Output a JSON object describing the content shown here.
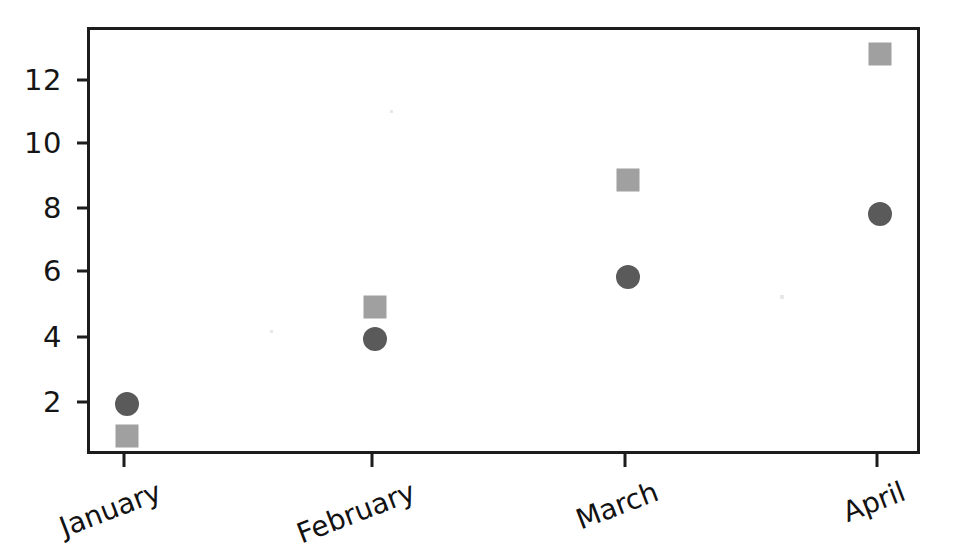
{
  "chart_data": {
    "type": "scatter",
    "title": "",
    "xlabel": "",
    "ylabel": "",
    "categories": [
      "January",
      "February",
      "March",
      "April"
    ],
    "series": [
      {
        "name": "Circle series",
        "marker": "circle",
        "color": "#5a5a5a",
        "values": [
          2.0,
          4.0,
          5.9,
          7.85
        ]
      },
      {
        "name": "Square series",
        "marker": "square",
        "color": "#a0a0a0",
        "values": [
          1.0,
          5.0,
          8.9,
          12.8
        ]
      }
    ],
    "ylim": [
      0.35,
      13.55
    ],
    "yticks": [
      2,
      4,
      6,
      8,
      10,
      12
    ],
    "ytick_labels": [
      "2",
      "4",
      "6",
      "8",
      "10",
      "12"
    ],
    "xtick_labels": [
      "January",
      "February",
      "March",
      "April"
    ],
    "xtick_rotation_degrees": -21,
    "grid": false,
    "legend": "none",
    "frame": "box"
  },
  "axes": {
    "y_tick_0": "2",
    "y_tick_1": "4",
    "y_tick_2": "6",
    "y_tick_3": "8",
    "y_tick_4": "10",
    "y_tick_5": "12",
    "x_tick_0": "January",
    "x_tick_1": "February",
    "x_tick_2": "March",
    "x_tick_3": "April"
  },
  "style": {
    "background": "#ffffff",
    "axis_color": "#1c1c1c",
    "circle_color": "#5a5a5a",
    "square_color": "#a0a0a0",
    "text_color": "#151515"
  }
}
